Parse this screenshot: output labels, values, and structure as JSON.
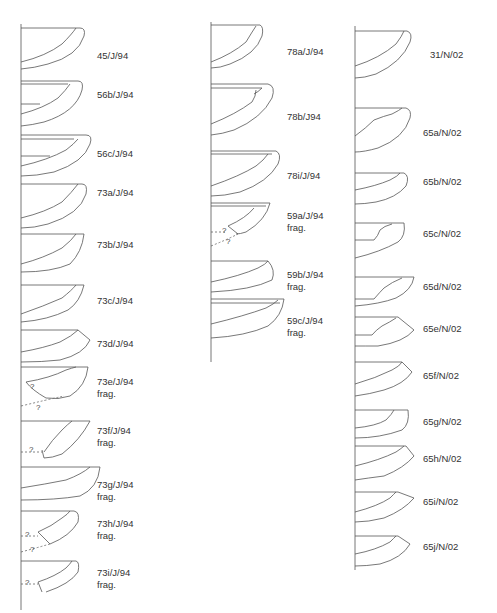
{
  "figure": {
    "type": "pottery rim profile drawings",
    "columns": [
      {
        "id": "left",
        "axis_x": 21,
        "axis_y": [
          24,
          610
        ],
        "profiles": [
          {
            "label": "45/J/94",
            "note": "",
            "y": 27
          },
          {
            "label": "56b/J/94",
            "note": "",
            "y": 80
          },
          {
            "label": "56c/J/94",
            "note": "",
            "y": 134
          },
          {
            "label": "73a/J/94",
            "note": "",
            "y": 183
          },
          {
            "label": "73b/J/94",
            "note": "",
            "y": 233
          },
          {
            "label": "73c/J/94",
            "note": "",
            "y": 284
          },
          {
            "label": "73d/J/94",
            "note": "",
            "y": 329
          },
          {
            "label": "73e/J/94",
            "note": "frag.",
            "y": 366
          },
          {
            "label": "73f/J/94",
            "note": "frag.",
            "y": 420
          },
          {
            "label": "73g/J/94",
            "note": "frag.",
            "y": 466
          },
          {
            "label": "73h/J/94",
            "note": "frag.",
            "y": 510
          },
          {
            "label": "73i/J/94",
            "note": "frag.",
            "y": 560
          }
        ]
      },
      {
        "id": "middle",
        "axis_x": 211,
        "axis_y": [
          22,
          362
        ],
        "profiles": [
          {
            "label": "78a/J/94",
            "note": "",
            "y": 24
          },
          {
            "label": "78b/J/94",
            "note": "",
            "y": 83
          },
          {
            "label": "78i/J/94",
            "note": "",
            "y": 150
          },
          {
            "label": "59a/J/94",
            "note": "frag.",
            "y": 202
          },
          {
            "label": "59b/J/94",
            "note": "frag.",
            "y": 260
          },
          {
            "label": "59c/J/94",
            "note": "frag.",
            "y": 298
          }
        ]
      },
      {
        "id": "right",
        "axis_x": 355,
        "axis_y": [
          26,
          570
        ],
        "profiles": [
          {
            "label": "31/N/02",
            "note": "",
            "y": 30
          },
          {
            "label": "65a/N/02",
            "note": "",
            "y": 108
          },
          {
            "label": "65b/N/02",
            "note": "",
            "y": 172
          },
          {
            "label": "65c/N/02",
            "note": "",
            "y": 223
          },
          {
            "label": "65d/N/02",
            "note": "",
            "y": 277
          },
          {
            "label": "65e/N/02",
            "note": "",
            "y": 316
          },
          {
            "label": "65f/N/02",
            "note": "",
            "y": 362
          },
          {
            "label": "65g/N/02",
            "note": "",
            "y": 410
          },
          {
            "label": "65h/N/02",
            "note": "",
            "y": 445
          },
          {
            "label": "65i/N/02",
            "note": "",
            "y": 492
          },
          {
            "label": "65j/N/02",
            "note": "",
            "y": 536
          }
        ]
      }
    ],
    "uncertainty_mark": "?"
  },
  "labels": {
    "l0": "45/J/94",
    "l1": "56b/J/94",
    "l2": "56c/J/94",
    "l3": "73a/J/94",
    "l4": "73b/J/94",
    "l5": "73c/J/94",
    "l6": "73d/J/94",
    "l7": "73e/J/94",
    "l8": "73f/J/94",
    "l9": "73g/J/94",
    "l10": "73h/J/94",
    "l11": "73i/J/94",
    "m0": "78a/J/94",
    "m1": "78b/J94",
    "m2": "78i/J/94",
    "m3": "59a/J/94",
    "m4": "59b/J/94",
    "m5": "59c/J/94",
    "r0": "31/N/02",
    "r1": "65a/N/02",
    "r2": "65b/N/02",
    "r3": "65c/N/02",
    "r4": "65d/N/02",
    "r5": "65e/N/02",
    "r6": "65f/N/02",
    "r7": "65g/N/02",
    "r8": "65h/N/02",
    "r9": "65i/N/02",
    "r10": "65j/N/02",
    "frag": "frag.",
    "q": "?"
  }
}
